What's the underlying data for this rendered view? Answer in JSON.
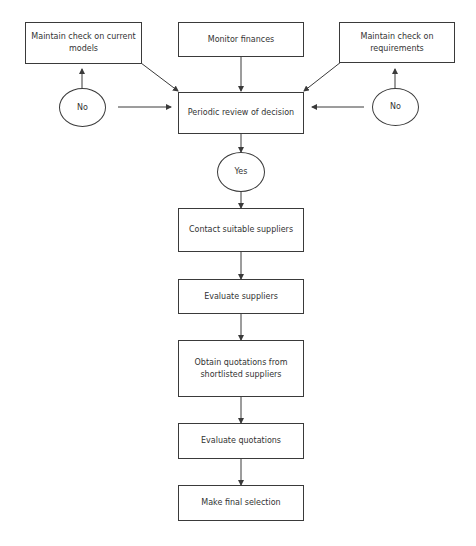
{
  "diagram": {
    "type": "flowchart",
    "colors": {
      "line": "#3a3a3a",
      "text": "#333333",
      "background": "#ffffff"
    },
    "nodes": {
      "check_models": {
        "label": "Maintain check on current models",
        "shape": "rect"
      },
      "monitor_finances": {
        "label": "Monitor finances",
        "shape": "rect"
      },
      "check_requirements": {
        "label": "Maintain check on requirements",
        "shape": "rect"
      },
      "no_left": {
        "label": "No",
        "shape": "ellipse"
      },
      "no_right": {
        "label": "No",
        "shape": "ellipse"
      },
      "periodic_review": {
        "label": "Periodic review of decision",
        "shape": "rect"
      },
      "yes": {
        "label": "Yes",
        "shape": "ellipse"
      },
      "contact_suppliers": {
        "label": "Contact suitable suppliers",
        "shape": "rect"
      },
      "evaluate_suppliers": {
        "label": "Evaluate suppliers",
        "shape": "rect"
      },
      "obtain_quotations": {
        "label": "Obtain quotations from shortlisted suppliers",
        "shape": "rect"
      },
      "evaluate_quotations": {
        "label": "Evaluate quotations",
        "shape": "rect"
      },
      "final_selection": {
        "label": "Make final selection",
        "shape": "rect"
      }
    },
    "edges": [
      {
        "from": "check_models",
        "to": "periodic_review"
      },
      {
        "from": "monitor_finances",
        "to": "periodic_review"
      },
      {
        "from": "check_requirements",
        "to": "periodic_review"
      },
      {
        "from": "no_left",
        "to": "check_models"
      },
      {
        "from": "no_left",
        "to": "periodic_review"
      },
      {
        "from": "no_right",
        "to": "check_requirements"
      },
      {
        "from": "no_right",
        "to": "periodic_review"
      },
      {
        "from": "periodic_review",
        "to": "yes"
      },
      {
        "from": "yes",
        "to": "contact_suppliers"
      },
      {
        "from": "contact_suppliers",
        "to": "evaluate_suppliers"
      },
      {
        "from": "evaluate_suppliers",
        "to": "obtain_quotations"
      },
      {
        "from": "obtain_quotations",
        "to": "evaluate_quotations"
      },
      {
        "from": "evaluate_quotations",
        "to": "final_selection"
      }
    ]
  }
}
